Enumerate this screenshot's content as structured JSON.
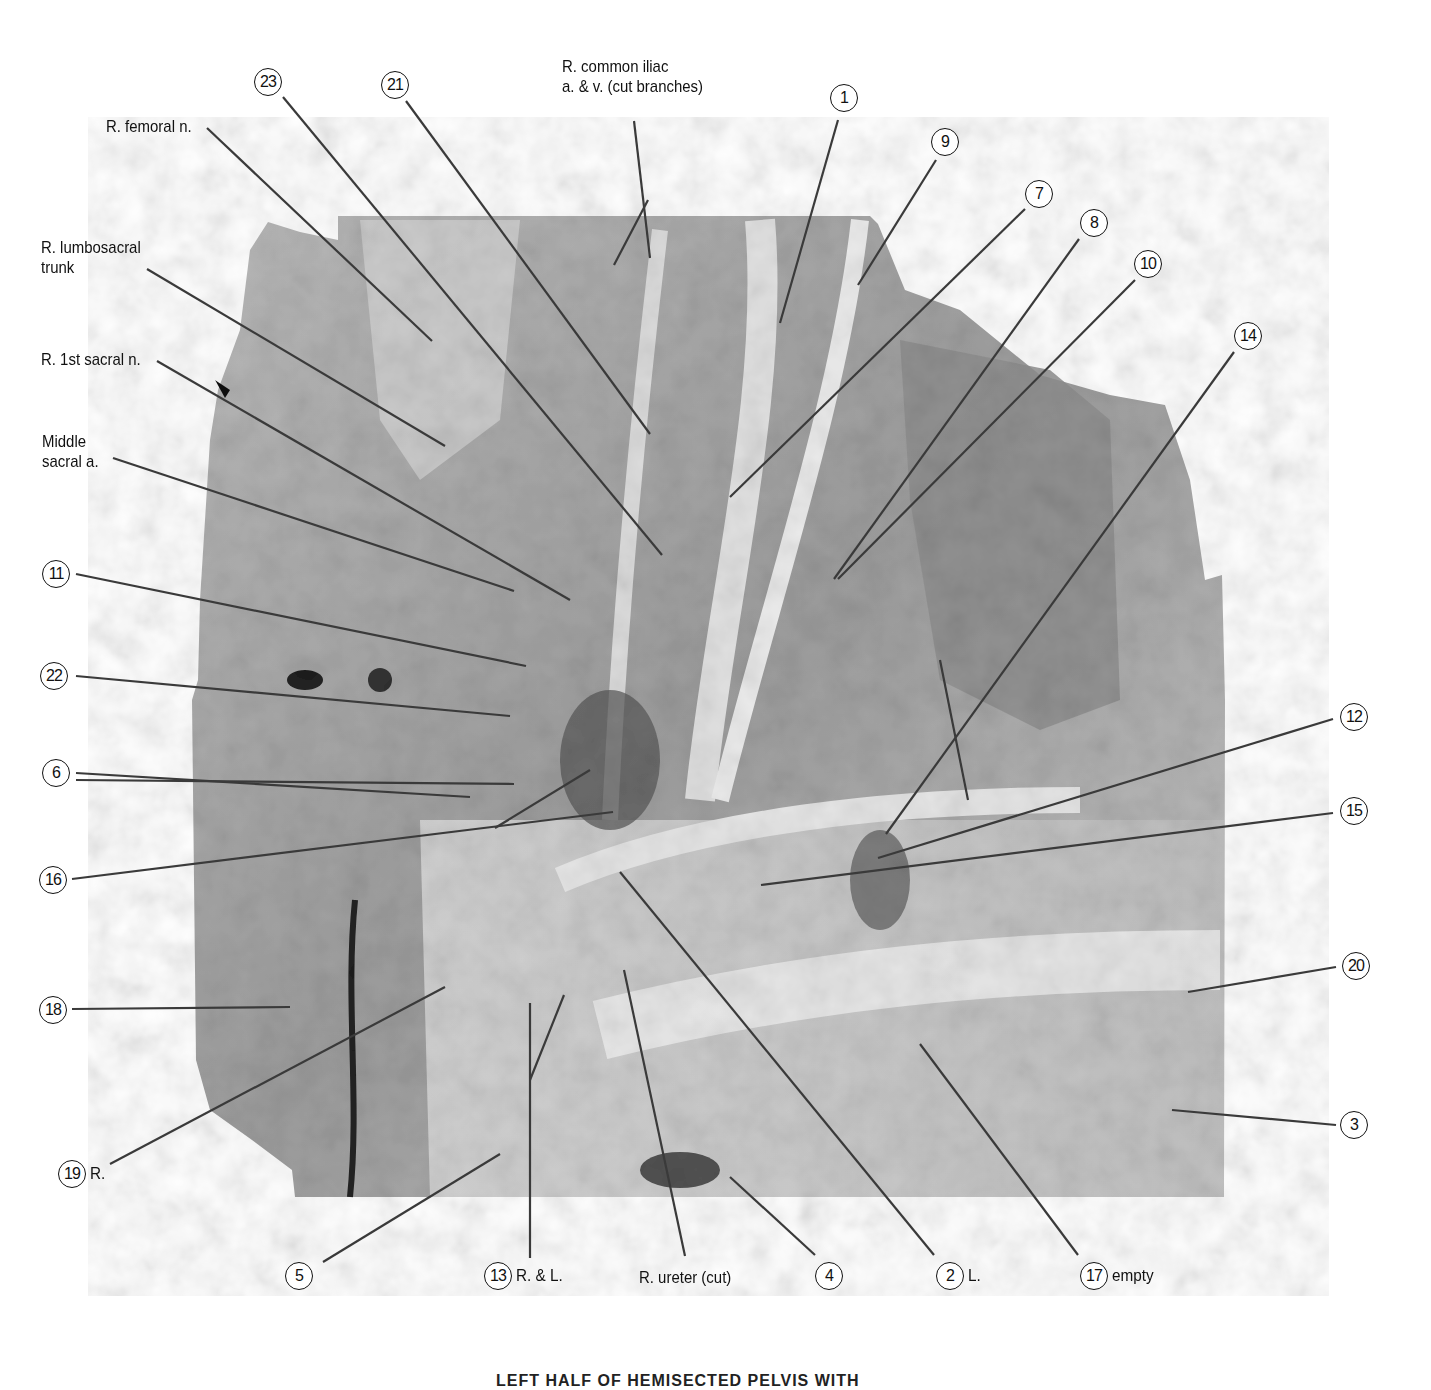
{
  "figure": {
    "caption": "LEFT HALF OF HEMISECTED PELVIS WITH",
    "photo_description": "grayscale dissection photograph of hemisected pelvis",
    "colors": {
      "background": "#ffffff",
      "line": "#444444",
      "text": "#111111"
    }
  },
  "text_labels": [
    {
      "id": "r-femoral-n",
      "lines": [
        "R. femoral n."
      ]
    },
    {
      "id": "r-lumbosacral-trunk",
      "lines": [
        "R. lumbosacral",
        "trunk"
      ]
    },
    {
      "id": "r-1st-sacral-n",
      "lines": [
        "R. 1st sacral n."
      ]
    },
    {
      "id": "middle-sacral-a",
      "lines": [
        "Middle",
        "sacral a."
      ]
    },
    {
      "id": "r-common-iliac",
      "lines": [
        "R. common iliac",
        "a. & v. (cut branches)"
      ]
    },
    {
      "id": "r-ureter-cut",
      "lines": [
        "R. ureter (cut)"
      ]
    }
  ],
  "callouts": [
    {
      "number": "23",
      "suffix": ""
    },
    {
      "number": "21",
      "suffix": ""
    },
    {
      "number": "1",
      "suffix": ""
    },
    {
      "number": "9",
      "suffix": ""
    },
    {
      "number": "7",
      "suffix": ""
    },
    {
      "number": "8",
      "suffix": ""
    },
    {
      "number": "10",
      "suffix": ""
    },
    {
      "number": "14",
      "suffix": ""
    },
    {
      "number": "11",
      "suffix": ""
    },
    {
      "number": "22",
      "suffix": ""
    },
    {
      "number": "6",
      "suffix": ""
    },
    {
      "number": "16",
      "suffix": ""
    },
    {
      "number": "18",
      "suffix": ""
    },
    {
      "number": "19",
      "suffix": "R."
    },
    {
      "number": "12",
      "suffix": ""
    },
    {
      "number": "15",
      "suffix": ""
    },
    {
      "number": "20",
      "suffix": ""
    },
    {
      "number": "3",
      "suffix": ""
    },
    {
      "number": "5",
      "suffix": ""
    },
    {
      "number": "13",
      "suffix": "R. & L."
    },
    {
      "number": "4",
      "suffix": ""
    },
    {
      "number": "2",
      "suffix": "L."
    },
    {
      "number": "17",
      "suffix": "empty"
    }
  ]
}
